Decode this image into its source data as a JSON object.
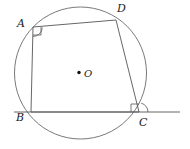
{
  "figure": {
    "canvas": {
      "width": 190,
      "height": 149
    },
    "colors": {
      "stroke": "#555555",
      "circle_stroke": "#6a6a6a",
      "label_color": "#222222",
      "background": "#ffffff"
    },
    "circle": {
      "name": "circle-O",
      "center_x": 80.5,
      "center_y": 73,
      "radius": 66,
      "stroke_width": 0.9
    },
    "center_point": {
      "label": "O",
      "dot_x": 79,
      "dot_y": 72.5,
      "dot_radius": 1.7,
      "label_x": 84,
      "label_y": 69
    },
    "vertices": [
      {
        "id": "A",
        "label": "A",
        "x": 33,
        "y": 27,
        "label_x": 17,
        "label_y": 18
      },
      {
        "id": "D",
        "label": "D",
        "x": 116,
        "y": 20,
        "label_x": 117,
        "label_y": 3
      },
      {
        "id": "B",
        "label": "B",
        "x": 31,
        "y": 112,
        "label_x": 16,
        "label_y": 112
      },
      {
        "id": "C",
        "label": "C",
        "x": 139,
        "y": 112,
        "label_x": 139,
        "label_y": 117
      }
    ],
    "quadrilateral_sides": [
      {
        "name": "side-AD",
        "x1": 33,
        "y1": 27,
        "x2": 116,
        "y2": 20
      },
      {
        "name": "side-DC",
        "x1": 116,
        "y1": 20,
        "x2": 139,
        "y2": 112
      },
      {
        "name": "side-CB",
        "x1": 139,
        "y1": 112,
        "x2": 31,
        "y2": 112
      },
      {
        "name": "side-BA",
        "x1": 31,
        "y1": 112,
        "x2": 33,
        "y2": 27
      }
    ],
    "tangent_line": {
      "name": "tangent-at-C",
      "x1": 14,
      "y1": 112,
      "x2": 180,
      "y2": 112
    },
    "right_angle_marks": [
      {
        "name": "right-angle-at-A",
        "points": "33,35 41,35 41,27"
      },
      {
        "name": "right-angle-at-C",
        "points": "139,104 131,104 131,112"
      }
    ],
    "angle_arcs": [
      {
        "name": "angle-arc-at-A",
        "path": "M 33 36.5 A 9.5 9.5 0 0 0 42.3 27.6"
      },
      {
        "name": "angle-arc-at-C",
        "path": "M 148 112 A 9 9 0 0 0 141.2 103.2"
      }
    ]
  }
}
